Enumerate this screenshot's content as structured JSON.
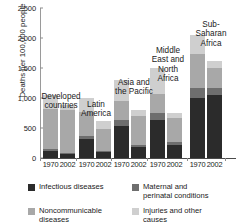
{
  "chart_data": {
    "type": "bar",
    "title": "",
    "subtitle": "",
    "stacked": true,
    "xlabel": "",
    "ylabel": "Deaths per 100,000 people",
    "ylim": [
      0,
      2500
    ],
    "yticks": [
      0,
      500,
      1000,
      1500,
      2000,
      2500
    ],
    "ytick_labels": [
      "0",
      "500",
      "1,000",
      "1,500",
      "2,000",
      "2,500"
    ],
    "grid": false,
    "legend_position": "bottom",
    "groups": [
      "Developed countries",
      "Latin America",
      "Asia and the Pacific",
      "Middle East and North Africa",
      "Sub-Saharan Africa"
    ],
    "group_labels_display": [
      "Developed\ncountries",
      "Latin\nAmerica",
      "Asia and\nthe Pacific",
      "Middle\nEast and\nNorth\nAfrica",
      "Sub-\nSaharan\nAfrica"
    ],
    "categories": [
      "1970",
      "2002",
      "1970",
      "2002",
      "1970",
      "2002",
      "1970",
      "2002",
      "1970",
      "2002"
    ],
    "series": [
      {
        "name": "Infectious diseases",
        "color": "#2b2b2b",
        "values": [
          120,
          70,
          310,
          100,
          530,
          190,
          630,
          215,
          1000,
          1050
        ]
      },
      {
        "name": "Maternal and perinatal conditions",
        "color": "#6e6e6e",
        "values": [
          30,
          15,
          65,
          25,
          105,
          35,
          115,
          45,
          165,
          115
        ]
      },
      {
        "name": "Noncommunicable diseases",
        "color": "#a8a8a8",
        "values": [
          660,
          720,
          400,
          355,
          320,
          480,
          325,
          400,
          565,
          340
        ]
      },
      {
        "name": "Injuries and other causes",
        "color": "#cfcfcf",
        "values": [
          240,
          85,
          225,
          130,
          345,
          95,
          430,
          85,
          320,
          115
        ]
      }
    ],
    "totals": [
      1050,
      890,
      1000,
      610,
      1300,
      800,
      1500,
      745,
      2050,
      1620
    ],
    "legend": [
      {
        "label": "Infectious diseases",
        "color": "#2b2b2b"
      },
      {
        "label": "Maternal and\nperinatal conditions",
        "color": "#6e6e6e"
      },
      {
        "label": "Noncommunicable\ndiseases",
        "color": "#a8a8a8"
      },
      {
        "label": "Injuries and other\ncauses",
        "color": "#cfcfcf"
      }
    ]
  }
}
